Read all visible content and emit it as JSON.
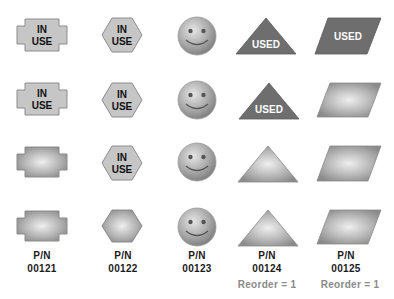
{
  "colors": {
    "flat_fill": "#c6c6c6",
    "flat_stroke": "#8c8c8c",
    "used_fill": "#6e6e6e",
    "gradient_center": "#ececec",
    "gradient_edge": "#8e8e8e",
    "label_text": "#1a1a1a",
    "reorder_text": "#8a8a8a"
  },
  "columns": [
    {
      "shape": "plus-block",
      "rows": [
        "IN USE",
        "IN USE",
        "",
        ""
      ],
      "part_label": "P/N",
      "part_number": "00121",
      "reorder": ""
    },
    {
      "shape": "hexagon",
      "rows": [
        "IN USE",
        "IN USE",
        "IN USE",
        ""
      ],
      "part_label": "P/N",
      "part_number": "00122",
      "reorder": ""
    },
    {
      "shape": "smiley-face",
      "rows": [
        "",
        "",
        "",
        ""
      ],
      "part_label": "P/N",
      "part_number": "00123",
      "reorder": ""
    },
    {
      "shape": "triangle",
      "rows": [
        "USED",
        "USED",
        "",
        ""
      ],
      "part_label": "P/N",
      "part_number": "00124",
      "reorder": "Reorder  = 1"
    },
    {
      "shape": "parallelogram",
      "rows": [
        "USED",
        "",
        "",
        ""
      ],
      "part_label": "P/N",
      "part_number": "00125",
      "reorder": "Reorder  = 1"
    }
  ],
  "text": {
    "in_use_line1": "IN",
    "in_use_line2": "USE",
    "used": "USED"
  }
}
